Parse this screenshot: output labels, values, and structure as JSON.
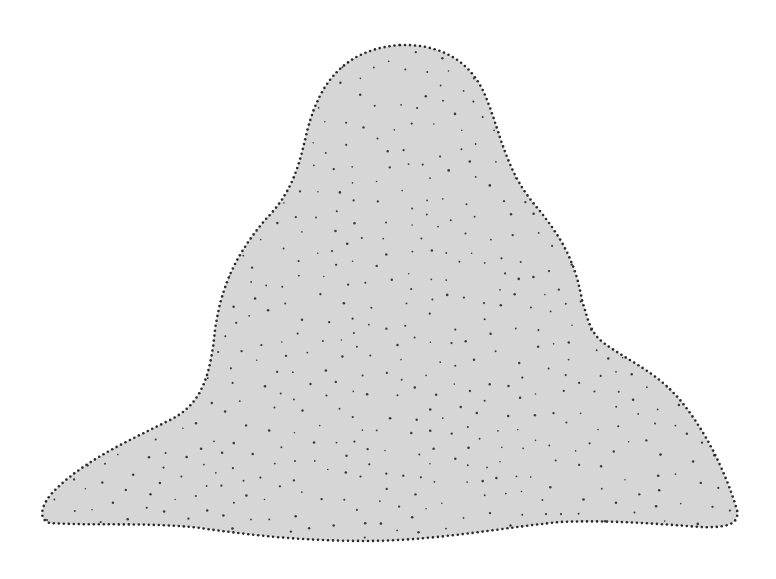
{
  "figure": {
    "fill_color": "#d6d6d6",
    "outline_dot_color": "#2a2a2a",
    "interior_dot_color": "#3a3a3a",
    "background_color": "#ffffff",
    "outline_path": "M 400 45 C 440 44, 470 60, 485 95 C 500 130, 505 170, 535 205 C 560 235, 575 260, 582 300 C 588 320, 590 330, 600 340 C 625 360, 655 370, 680 400 C 705 430, 725 470, 737 510 C 740 525, 725 528, 700 527 C 650 523, 600 520, 560 522 C 500 528, 440 540, 370 541 C 300 541, 250 535, 200 528 C 150 522, 90 526, 50 523 C 38 520, 40 505, 55 490 C 85 460, 130 440, 170 420 C 200 405, 210 380, 215 330 C 222 280, 240 250, 265 220 C 290 195, 298 170, 305 140 C 315 95, 335 50, 400 45 Z",
    "outline_dot_spacing": 5,
    "outline_dot_radius": 1.3,
    "interior_dot_count": 430,
    "interior_dot_radius": 1.1,
    "interior_dot_seed": 7
  }
}
